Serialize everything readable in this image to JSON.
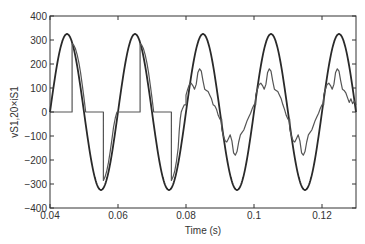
{
  "chart_data": {
    "type": "line",
    "title": "",
    "xlabel": "Time (s)",
    "ylabel": "vS1,20×iS1",
    "xlim": [
      0.04,
      0.13
    ],
    "ylim": [
      -400,
      400
    ],
    "xticks": [
      0.04,
      0.06,
      0.08,
      0.1,
      0.12
    ],
    "xtick_labels": [
      "0.04",
      "0.06",
      "0.08",
      "0.1",
      "0.12"
    ],
    "yticks": [
      400,
      300,
      200,
      100,
      0,
      -100,
      -200,
      -300,
      -400
    ],
    "ytick_labels": [
      "400",
      "300",
      "200",
      "100",
      "0",
      "−100",
      "−200",
      "−300",
      "−400"
    ],
    "grid": false,
    "legend": null,
    "series": [
      {
        "name": "vS1",
        "color": "#2a2a2a",
        "width": 1.8,
        "kind": "sine",
        "amplitude": 325,
        "frequency_hz": 50,
        "phase_zero_s": 0.04
      },
      {
        "name": "20×iS1",
        "color": "#555555",
        "width": 1.2,
        "points": [
          [
            0.04,
            0
          ],
          [
            0.0465,
            0
          ],
          [
            0.0465,
            285
          ],
          [
            0.047,
            278
          ],
          [
            0.0475,
            263
          ],
          [
            0.048,
            238
          ],
          [
            0.0485,
            205
          ],
          [
            0.049,
            163
          ],
          [
            0.0495,
            112
          ],
          [
            0.05,
            58
          ],
          [
            0.0505,
            0
          ],
          [
            0.0557,
            0
          ],
          [
            0.0557,
            -285
          ],
          [
            0.0562,
            -270
          ],
          [
            0.0567,
            -245
          ],
          [
            0.0572,
            -210
          ],
          [
            0.0577,
            -165
          ],
          [
            0.0582,
            -115
          ],
          [
            0.0587,
            -62
          ],
          [
            0.0592,
            -25
          ],
          [
            0.0597,
            0
          ],
          [
            0.0665,
            0
          ],
          [
            0.0665,
            285
          ],
          [
            0.067,
            278
          ],
          [
            0.0675,
            263
          ],
          [
            0.068,
            238
          ],
          [
            0.0685,
            205
          ],
          [
            0.069,
            163
          ],
          [
            0.0695,
            112
          ],
          [
            0.07,
            58
          ],
          [
            0.0705,
            0
          ],
          [
            0.0757,
            0
          ],
          [
            0.0757,
            -285
          ],
          [
            0.0762,
            -270
          ],
          [
            0.0767,
            -245
          ],
          [
            0.0772,
            -205
          ],
          [
            0.0777,
            -150
          ],
          [
            0.078,
            -80
          ],
          [
            0.0783,
            -30
          ],
          [
            0.0786,
            0
          ],
          [
            0.079,
            15
          ],
          [
            0.0795,
            30
          ],
          [
            0.08,
            30
          ],
          [
            0.08,
            70
          ],
          [
            0.0805,
            95
          ],
          [
            0.081,
            115
          ],
          [
            0.0815,
            120
          ],
          [
            0.082,
            110
          ],
          [
            0.0825,
            95
          ],
          [
            0.083,
            115
          ],
          [
            0.0835,
            165
          ],
          [
            0.084,
            180
          ],
          [
            0.0845,
            170
          ],
          [
            0.085,
            130
          ],
          [
            0.0855,
            95
          ],
          [
            0.086,
            90
          ],
          [
            0.0865,
            85
          ],
          [
            0.087,
            70
          ],
          [
            0.0875,
            55
          ],
          [
            0.088,
            30
          ],
          [
            0.0885,
            25
          ],
          [
            0.089,
            10
          ],
          [
            0.0895,
            -15
          ],
          [
            0.09,
            -30
          ],
          [
            0.0905,
            -30
          ],
          [
            0.0905,
            -70
          ],
          [
            0.091,
            -100
          ],
          [
            0.0915,
            -120
          ],
          [
            0.092,
            -125
          ],
          [
            0.0925,
            -110
          ],
          [
            0.093,
            -95
          ],
          [
            0.0935,
            -120
          ],
          [
            0.094,
            -170
          ],
          [
            0.0945,
            -180
          ],
          [
            0.095,
            -165
          ],
          [
            0.0955,
            -125
          ],
          [
            0.096,
            -95
          ],
          [
            0.0965,
            -85
          ],
          [
            0.097,
            -75
          ],
          [
            0.0975,
            -55
          ],
          [
            0.098,
            -35
          ],
          [
            0.0985,
            -20
          ],
          [
            0.099,
            -5
          ],
          [
            0.0995,
            15
          ],
          [
            0.1,
            30
          ],
          [
            0.1005,
            30
          ],
          [
            0.1005,
            70
          ],
          [
            0.101,
            95
          ],
          [
            0.1015,
            115
          ],
          [
            0.102,
            120
          ],
          [
            0.1025,
            110
          ],
          [
            0.103,
            95
          ],
          [
            0.1035,
            115
          ],
          [
            0.104,
            165
          ],
          [
            0.1045,
            180
          ],
          [
            0.105,
            170
          ],
          [
            0.1055,
            130
          ],
          [
            0.106,
            95
          ],
          [
            0.1065,
            90
          ],
          [
            0.107,
            85
          ],
          [
            0.1075,
            70
          ],
          [
            0.108,
            55
          ],
          [
            0.1085,
            30
          ],
          [
            0.109,
            10
          ],
          [
            0.1095,
            -15
          ],
          [
            0.11,
            -30
          ],
          [
            0.1105,
            -30
          ],
          [
            0.1105,
            -70
          ],
          [
            0.111,
            -100
          ],
          [
            0.1115,
            -120
          ],
          [
            0.112,
            -125
          ],
          [
            0.1125,
            -110
          ],
          [
            0.113,
            -95
          ],
          [
            0.1135,
            -120
          ],
          [
            0.114,
            -170
          ],
          [
            0.1145,
            -180
          ],
          [
            0.115,
            -165
          ],
          [
            0.1155,
            -125
          ],
          [
            0.116,
            -95
          ],
          [
            0.1165,
            -85
          ],
          [
            0.117,
            -75
          ],
          [
            0.1175,
            -55
          ],
          [
            0.118,
            -35
          ],
          [
            0.1185,
            -20
          ],
          [
            0.119,
            -5
          ],
          [
            0.1195,
            15
          ],
          [
            0.12,
            30
          ],
          [
            0.1205,
            30
          ],
          [
            0.1205,
            70
          ],
          [
            0.121,
            95
          ],
          [
            0.1215,
            115
          ],
          [
            0.122,
            120
          ],
          [
            0.1225,
            110
          ],
          [
            0.123,
            95
          ],
          [
            0.1235,
            115
          ],
          [
            0.124,
            165
          ],
          [
            0.1245,
            180
          ],
          [
            0.125,
            170
          ],
          [
            0.1255,
            130
          ],
          [
            0.126,
            95
          ],
          [
            0.1265,
            90
          ],
          [
            0.127,
            80
          ],
          [
            0.1275,
            60
          ],
          [
            0.128,
            40
          ],
          [
            0.1285,
            55
          ],
          [
            0.129,
            35
          ],
          [
            0.1295,
            45
          ],
          [
            0.13,
            30
          ]
        ]
      }
    ]
  }
}
